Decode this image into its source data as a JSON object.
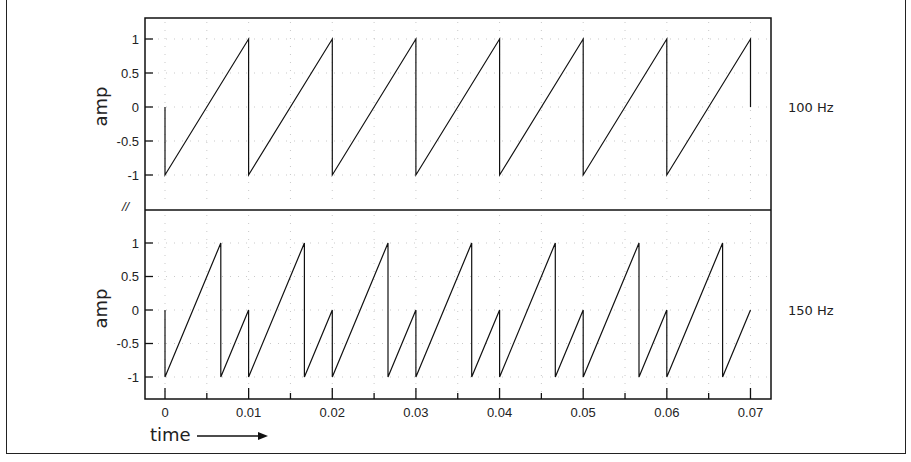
{
  "chart_data": [
    {
      "type": "line",
      "title": "",
      "panel": "top",
      "series_label": "100 Hz",
      "ylabel": "amp",
      "xlabel": "time",
      "xlim": [
        0,
        0.07
      ],
      "ylim": [
        -1,
        1
      ],
      "yticks": [
        1,
        0.5,
        0,
        -0.5,
        -1
      ],
      "ytick_labels": [
        "1",
        "0.5",
        "0",
        "-0.5",
        "-1"
      ],
      "grid": true,
      "x": [
        0,
        0,
        0.01,
        0.01,
        0.02,
        0.02,
        0.03,
        0.03,
        0.04,
        0.04,
        0.05,
        0.05,
        0.06,
        0.06,
        0.07,
        0.07
      ],
      "y": [
        0,
        -1,
        1,
        -1,
        1,
        -1,
        1,
        -1,
        1,
        -1,
        1,
        -1,
        1,
        -1,
        1,
        0
      ]
    },
    {
      "type": "line",
      "title": "",
      "panel": "bottom",
      "series_label": "150 Hz",
      "ylabel": "amp",
      "xlabel": "time",
      "xlim": [
        0,
        0.07
      ],
      "ylim": [
        -1,
        1
      ],
      "yticks": [
        1,
        0.5,
        0,
        -0.5,
        -1
      ],
      "ytick_labels": [
        "1",
        "0.5",
        "0",
        "-0.5",
        "-1"
      ],
      "xticks": [
        0,
        0.01,
        0.02,
        0.03,
        0.04,
        0.05,
        0.06,
        0.07
      ],
      "xtick_labels": [
        "0",
        "0.01",
        "0.02",
        "0.03",
        "0.04",
        "0.05",
        "0.06",
        "0.07"
      ],
      "grid": true,
      "x": [
        0,
        0,
        0.006667,
        0.006667,
        0.01,
        0.01,
        0.016667,
        0.016667,
        0.02,
        0.02,
        0.026667,
        0.026667,
        0.03,
        0.03,
        0.036667,
        0.036667,
        0.04,
        0.04,
        0.046667,
        0.046667,
        0.05,
        0.05,
        0.056667,
        0.056667,
        0.06,
        0.06,
        0.066667,
        0.066667,
        0.07
      ],
      "y": [
        0,
        -1,
        1,
        -1,
        0,
        -1,
        1,
        -1,
        0,
        -1,
        1,
        -1,
        0,
        -1,
        1,
        -1,
        0,
        -1,
        1,
        -1,
        0,
        -1,
        1,
        -1,
        0,
        -1,
        1,
        -1,
        0
      ]
    }
  ],
  "labels": {
    "top_freq": "100 Hz",
    "bottom_freq": "150 Hz",
    "top_ylabel": "amp",
    "bottom_ylabel": "amp",
    "xlabel": "time",
    "break_mark": "//"
  }
}
